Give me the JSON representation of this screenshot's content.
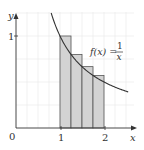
{
  "chart_data": {
    "type": "bar",
    "title": "",
    "xlabel": "x",
    "ylabel": "y",
    "function_label": "f(x) = 1/x",
    "function_label_parts": {
      "lhs": "f(x) =",
      "num": "1",
      "den": "x"
    },
    "origin_label": "0",
    "x_ticks": [
      "1",
      "2"
    ],
    "y_ticks": [
      "1"
    ],
    "xlim": [
      0,
      2.6
    ],
    "ylim": [
      0,
      1.25
    ],
    "grid": true,
    "categories": [
      "[1, 1.25]",
      "[1.25, 1.5]",
      "[1.5, 1.75]",
      "[1.75, 2]"
    ],
    "bar_left_edges": [
      1.0,
      1.25,
      1.5,
      1.75
    ],
    "bar_width": 0.25,
    "values": [
      1.0,
      0.8,
      0.667,
      0.571
    ],
    "curve": {
      "name": "f(x) = 1/x",
      "x_range": [
        0.8,
        2.55
      ]
    },
    "colors": {
      "bar_fill": "#d3d3d3",
      "bar_stroke": "#555555",
      "curve": "#333333",
      "grid": "#e8e8e8",
      "axis": "#333333"
    }
  }
}
